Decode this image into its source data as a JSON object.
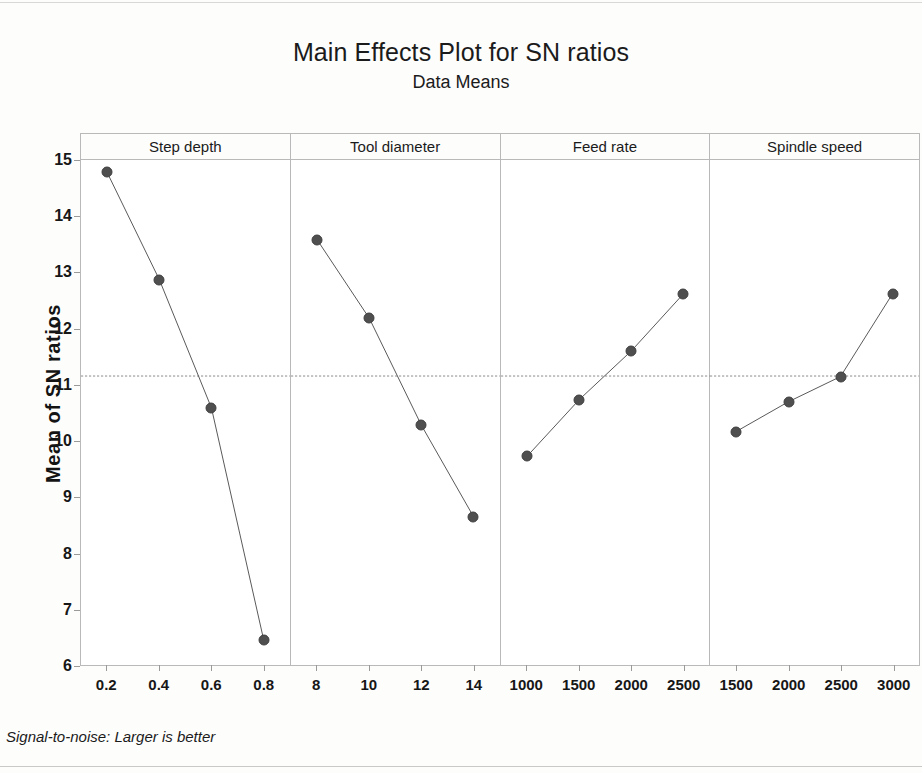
{
  "chart_data": {
    "type": "line",
    "title": "Main Effects Plot for SN ratios",
    "subtitle": "Data Means",
    "ylabel": "Mean of SN ratios",
    "xlabel": "",
    "ylim": [
      6,
      15
    ],
    "yticks": [
      15,
      14,
      13,
      12,
      11,
      10,
      9,
      8,
      7,
      6
    ],
    "grid": false,
    "legend": "none",
    "reference_line": {
      "label": "overall mean",
      "value": 11.15,
      "style": "dashed",
      "color": "#8c8c8c"
    },
    "marker_color": "#4f4f4f",
    "line_color": "#5a5a5a",
    "footnote": "Signal-to-noise: Larger is better",
    "panels": [
      {
        "name": "Step depth",
        "categories": [
          "0.2",
          "0.4",
          "0.6",
          "0.8"
        ],
        "values": [
          14.78,
          12.87,
          10.58,
          6.45
        ]
      },
      {
        "name": "Tool diameter",
        "categories": [
          "8",
          "10",
          "12",
          "14"
        ],
        "values": [
          13.58,
          12.18,
          10.27,
          8.64
        ]
      },
      {
        "name": "Feed rate",
        "categories": [
          "1000",
          "1500",
          "2000",
          "2500"
        ],
        "values": [
          9.72,
          10.73,
          11.6,
          12.62
        ]
      },
      {
        "name": "Spindle speed",
        "categories": [
          "1500",
          "2000",
          "2500",
          "3000"
        ],
        "values": [
          10.16,
          10.69,
          11.14,
          12.62
        ]
      }
    ]
  }
}
